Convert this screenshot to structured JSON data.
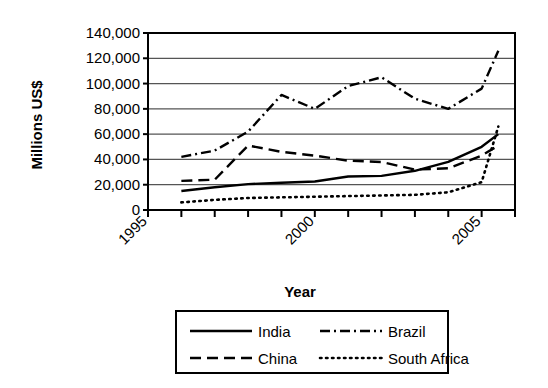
{
  "chart_data": {
    "type": "line",
    "title": "",
    "xlabel": "Year",
    "ylabel": "Millions US$",
    "xlim": [
      1995,
      2006
    ],
    "ylim": [
      0,
      140000
    ],
    "grid": true,
    "legend_position": "bottom",
    "x_tick_labels": [
      "1995",
      "2000",
      "2005"
    ],
    "x_tick_values": [
      1995,
      2000,
      2005
    ],
    "x_tick_all": [
      1995,
      1996,
      1997,
      1998,
      1999,
      2000,
      2001,
      2002,
      2003,
      2004,
      2005,
      2006
    ],
    "y_tick_labels": [
      "0",
      "20,000",
      "40,000",
      "60,000",
      "80,000",
      "100,000",
      "120,000",
      "140,000"
    ],
    "y_tick_values": [
      0,
      20000,
      40000,
      60000,
      80000,
      100000,
      120000,
      140000
    ],
    "x": [
      1996,
      1997,
      1998,
      1999,
      2000,
      2001,
      2002,
      2003,
      2004,
      2005,
      2005.5
    ],
    "series": [
      {
        "name": "India",
        "style": "solid",
        "values": [
          15000,
          18000,
          20500,
          21500,
          22500,
          26500,
          27000,
          31000,
          38000,
          50000,
          60000
        ]
      },
      {
        "name": "China",
        "style": "dashed",
        "values": [
          23000,
          24000,
          51000,
          46000,
          43000,
          39000,
          38000,
          32000,
          33000,
          43000,
          51000
        ]
      },
      {
        "name": "Brazil",
        "style": "dashdot",
        "values": [
          42000,
          47000,
          62000,
          91000,
          80000,
          98000,
          105000,
          88000,
          80000,
          96000,
          126000
        ]
      },
      {
        "name": "South Africa",
        "style": "dotted",
        "values": [
          6000,
          8000,
          9500,
          10000,
          10500,
          11000,
          11500,
          12000,
          14000,
          22000,
          66000
        ]
      }
    ]
  },
  "legend": {
    "entries": [
      {
        "label": "India",
        "style": "solid"
      },
      {
        "label": "Brazil",
        "style": "dashdot"
      },
      {
        "label": "China",
        "style": "dashed"
      },
      {
        "label": "South Africa",
        "style": "dotted"
      }
    ]
  }
}
